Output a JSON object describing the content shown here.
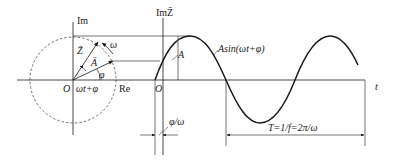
{
  "figure": {
    "phasor": {
      "im_axis_label": "Im",
      "re_axis_label": "Re",
      "origin_label": "O",
      "vector_Z_label": "Z̄",
      "vector_A_label": "Ā",
      "omega_label": "ω",
      "phi_label": "φ",
      "angle_label": "ωt+φ"
    },
    "waveform": {
      "im_axis_label": "ImZ̄",
      "origin_label": "O",
      "amplitude_label": "A",
      "function_label": "Asin(ωt+φ)",
      "time_axis_label": "t",
      "phase_shift_label": "φ/ω",
      "period_label": "T=1/f=2π/ω"
    },
    "colors": {
      "line": "#1a1a1a",
      "background": "#ffffff"
    }
  }
}
